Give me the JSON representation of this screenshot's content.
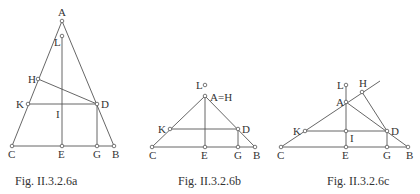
{
  "figures": [
    {
      "id": "a",
      "caption": "Fig. II.3.2.6a",
      "caption_pos": [
        15,
        185
      ],
      "points": {
        "A": [
          62,
          21
        ],
        "L": [
          62,
          36
        ],
        "H": [
          38,
          79
        ],
        "K": [
          28,
          104
        ],
        "D": [
          97,
          104
        ],
        "C": [
          12,
          146
        ],
        "E": [
          62,
          146
        ],
        "G": [
          97,
          146
        ],
        "B": [
          114,
          146
        ]
      },
      "open_points": [
        "A",
        "L",
        "H",
        "K",
        "D",
        "C",
        "E",
        "G",
        "B"
      ],
      "segments": [
        [
          "A",
          "C"
        ],
        [
          "A",
          "B"
        ],
        [
          "C",
          "B"
        ],
        [
          "L",
          "E"
        ],
        [
          "H",
          "D"
        ],
        [
          "K",
          "D"
        ],
        [
          "D",
          "G"
        ]
      ],
      "labels": [
        {
          "text": "A",
          "x": 58,
          "y": 16
        },
        {
          "text": "L",
          "x": 54,
          "y": 46
        },
        {
          "text": "H",
          "x": 28,
          "y": 83
        },
        {
          "text": "K",
          "x": 16,
          "y": 108
        },
        {
          "text": "D",
          "x": 101,
          "y": 108
        },
        {
          "text": "I",
          "x": 56,
          "y": 118
        },
        {
          "text": "C",
          "x": 8,
          "y": 158
        },
        {
          "text": "E",
          "x": 58,
          "y": 158
        },
        {
          "text": "G",
          "x": 93,
          "y": 158
        },
        {
          "text": "B",
          "x": 112,
          "y": 158
        }
      ]
    },
    {
      "id": "b",
      "caption": "Fig. II.3.2.6b",
      "caption_pos": [
        178,
        185
      ],
      "points": {
        "L": [
          205,
          85
        ],
        "A": [
          205,
          96
        ],
        "K": [
          170,
          129
        ],
        "D": [
          238,
          129
        ],
        "C": [
          152,
          147
        ],
        "E": [
          205,
          147
        ],
        "G": [
          238,
          147
        ],
        "B": [
          255,
          147
        ]
      },
      "open_points": [
        "L",
        "A",
        "K",
        "D",
        "C",
        "E",
        "G",
        "B"
      ],
      "segments": [
        [
          "A",
          "C"
        ],
        [
          "A",
          "B"
        ],
        [
          "C",
          "B"
        ],
        [
          "A",
          "E"
        ],
        [
          "K",
          "D"
        ],
        [
          "D",
          "G"
        ]
      ],
      "labels": [
        {
          "text": "L",
          "x": 196,
          "y": 89
        },
        {
          "text": "A=H",
          "x": 210,
          "y": 101
        },
        {
          "text": "K",
          "x": 158,
          "y": 133
        },
        {
          "text": "D",
          "x": 242,
          "y": 133
        },
        {
          "text": "C",
          "x": 149,
          "y": 159
        },
        {
          "text": "E",
          "x": 201,
          "y": 159
        },
        {
          "text": "G",
          "x": 234,
          "y": 159
        },
        {
          "text": "B",
          "x": 253,
          "y": 159
        }
      ]
    },
    {
      "id": "c",
      "caption": "Fig. II.3.2.6c",
      "caption_pos": [
        327,
        185
      ],
      "points": {
        "L": [
          346,
          85
        ],
        "H": [
          362,
          92
        ],
        "A": [
          346,
          102
        ],
        "K": [
          305,
          131
        ],
        "I": [
          346,
          131
        ],
        "D": [
          387,
          131
        ],
        "C": [
          281,
          147
        ],
        "E": [
          346,
          147
        ],
        "G": [
          387,
          147
        ],
        "B": [
          408,
          147
        ],
        "X": [
          380,
          81
        ]
      },
      "open_points": [
        "L",
        "H",
        "A",
        "K",
        "I",
        "D",
        "C",
        "E",
        "G",
        "B"
      ],
      "segments": [
        [
          "C",
          "X"
        ],
        [
          "A",
          "B"
        ],
        [
          "C",
          "B"
        ],
        [
          "L",
          "E"
        ],
        [
          "H",
          "D"
        ],
        [
          "K",
          "D"
        ],
        [
          "D",
          "G"
        ]
      ],
      "labels": [
        {
          "text": "L",
          "x": 337,
          "y": 89
        },
        {
          "text": "H",
          "x": 359,
          "y": 87
        },
        {
          "text": "A",
          "x": 336,
          "y": 106
        },
        {
          "text": "K",
          "x": 293,
          "y": 135
        },
        {
          "text": "D",
          "x": 391,
          "y": 135
        },
        {
          "text": "I",
          "x": 350,
          "y": 142
        },
        {
          "text": "C",
          "x": 277,
          "y": 159
        },
        {
          "text": "E",
          "x": 342,
          "y": 159
        },
        {
          "text": "G",
          "x": 383,
          "y": 159
        },
        {
          "text": "B",
          "x": 406,
          "y": 159
        }
      ]
    }
  ]
}
